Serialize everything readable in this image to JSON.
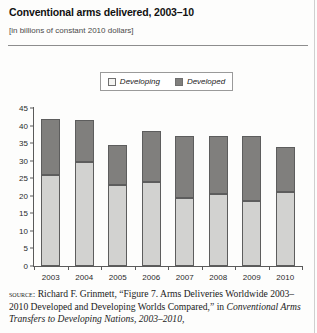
{
  "figure": {
    "title": "Conventional arms delivered, 2003–10",
    "subtitle": "[in billions of constant 2010 dollars]"
  },
  "legend": {
    "items": [
      {
        "label": "Developing",
        "swatch_color": "#f4f4f2"
      },
      {
        "label": "Developed",
        "swatch_color": "#807f7d"
      }
    ]
  },
  "source": {
    "label": "source:",
    "line1": " Richard F. Grinmett, “Figure 7. Arms Deliveries Worldwide",
    "line2": "2003–2010 Developed and Developing Worlds Compared,” in",
    "line3": "Conventional Arms Transfers to Developing Nations, 2003–2010,"
  },
  "chart_data": {
    "type": "bar",
    "title": "Conventional arms delivered, 2003–10",
    "subtitle": "[in billions of constant 2010 dollars]",
    "xlabel": "",
    "ylabel": "",
    "ylim": [
      0,
      45
    ],
    "yticks": [
      0,
      5,
      10,
      15,
      20,
      25,
      30,
      35,
      40,
      45
    ],
    "grid": false,
    "stacked": true,
    "legend_position": "top-center",
    "categories": [
      "2003",
      "2004",
      "2005",
      "2006",
      "2007",
      "2008",
      "2009",
      "2010"
    ],
    "series": [
      {
        "name": "Developing",
        "color": "#d2d2d0",
        "values": [
          26,
          29.5,
          23,
          24,
          19.5,
          20.5,
          18.5,
          21
        ]
      },
      {
        "name": "Developed",
        "color": "#807f7d",
        "values": [
          16,
          12,
          11.5,
          14.5,
          17.5,
          16.5,
          18.5,
          13
        ]
      }
    ],
    "totals": [
      42,
      41.5,
      34.5,
      38.5,
      37,
      37,
      37,
      34
    ]
  }
}
